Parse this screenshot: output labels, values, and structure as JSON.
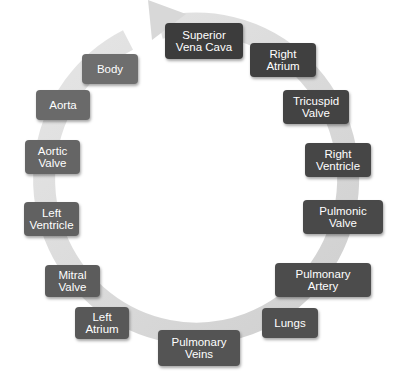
{
  "diagram": {
    "type": "cycle",
    "title": "",
    "ring_color": "#d4d4d4",
    "nodes": [
      {
        "id": "superior-vena-cava",
        "label": "Superior\nVena Cava",
        "color": "#3c3c3c"
      },
      {
        "id": "right-atrium",
        "label": "Right\nAtrium",
        "color": "#404040"
      },
      {
        "id": "tricuspid-valve",
        "label": "Tricuspid\nValve",
        "color": "#434343"
      },
      {
        "id": "right-ventricle",
        "label": "Right\nVentricle",
        "color": "#464646"
      },
      {
        "id": "pulmonic-valve",
        "label": "Pulmonic\nValve",
        "color": "#494949"
      },
      {
        "id": "pulmonary-artery",
        "label": "Pulmonary\nArtery",
        "color": "#4c4c4c"
      },
      {
        "id": "lungs",
        "label": "Lungs",
        "color": "#505050"
      },
      {
        "id": "pulmonary-veins",
        "label": "Pulmonary\nVeins",
        "color": "#545454"
      },
      {
        "id": "left-atrium",
        "label": "Left\nAtrium",
        "color": "#585858"
      },
      {
        "id": "mitral-valve",
        "label": "Mitral\nValve",
        "color": "#5c5c5c"
      },
      {
        "id": "left-ventricle",
        "label": "Left\nVentricle",
        "color": "#616161"
      },
      {
        "id": "aortic-valve",
        "label": "Aortic\nValve",
        "color": "#656565"
      },
      {
        "id": "aorta",
        "label": "Aorta",
        "color": "#6a6a6a"
      },
      {
        "id": "body",
        "label": "Body",
        "color": "#6e6e6e"
      }
    ],
    "edges": [
      [
        "superior-vena-cava",
        "right-atrium"
      ],
      [
        "right-atrium",
        "tricuspid-valve"
      ],
      [
        "tricuspid-valve",
        "right-ventricle"
      ],
      [
        "right-ventricle",
        "pulmonic-valve"
      ],
      [
        "pulmonic-valve",
        "pulmonary-artery"
      ],
      [
        "pulmonary-artery",
        "lungs"
      ],
      [
        "lungs",
        "pulmonary-veins"
      ],
      [
        "pulmonary-veins",
        "left-atrium"
      ],
      [
        "left-atrium",
        "mitral-valve"
      ],
      [
        "mitral-valve",
        "left-ventricle"
      ],
      [
        "left-ventricle",
        "aortic-valve"
      ],
      [
        "aortic-valve",
        "aorta"
      ],
      [
        "aorta",
        "body"
      ],
      [
        "body",
        "superior-vena-cava"
      ]
    ]
  }
}
